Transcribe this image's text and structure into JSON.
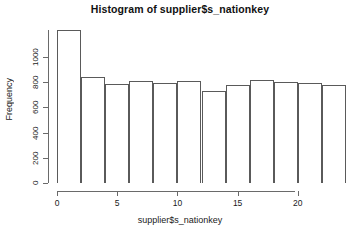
{
  "chart_data": {
    "type": "bar",
    "title": "Histogram of supplier$s_nationkey",
    "xlabel": "supplier$s_nationkey",
    "ylabel": "Frequency",
    "bin_width": 2,
    "bin_starts": [
      0,
      2,
      4,
      6,
      8,
      10,
      12,
      14,
      16,
      18,
      20,
      22
    ],
    "categories": [
      "0-2",
      "2-4",
      "4-6",
      "6-8",
      "8-10",
      "10-12",
      "12-14",
      "14-16",
      "16-18",
      "18-20",
      "20-22",
      "22-24"
    ],
    "values": [
      1215,
      845,
      785,
      810,
      795,
      810,
      730,
      775,
      820,
      800,
      790,
      775
    ],
    "xlim": [
      0,
      24
    ],
    "ylim": [
      0,
      1230
    ],
    "xticks": [
      0,
      5,
      10,
      15,
      20
    ],
    "yticks": [
      0,
      200,
      400,
      600,
      800,
      1000
    ],
    "grid": false,
    "legend": false,
    "bar_border_color": "#5a5a5a",
    "bar_fill_color": "#ffffff",
    "axis_color": "#6a6a6a",
    "background_color": "#ffffff"
  }
}
